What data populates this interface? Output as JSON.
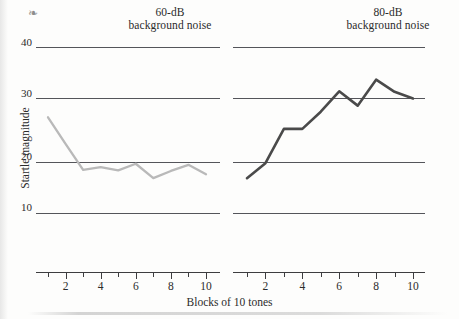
{
  "figure": {
    "ylabel": "Startle magnitude",
    "xlabel": "Blocks of 10 tones",
    "scan_mark": "❧"
  },
  "panels": [
    {
      "id": "left",
      "title_line1": "60-dB",
      "title_line2": "background noise",
      "color": "#b9b9b9"
    },
    {
      "id": "right",
      "title_line1": "80-dB",
      "title_line2": "background noise",
      "color": "#4a4a4a"
    }
  ],
  "yticks": [
    "40",
    "30",
    "20",
    "10"
  ],
  "xticklabels": [
    "2",
    "4",
    "6",
    "8",
    "10"
  ],
  "chart_data": {
    "type": "line",
    "xlabel": "Blocks of 10 tones",
    "ylabel": "Startle magnitude",
    "xlim": [
      1,
      10
    ],
    "ylim": [
      10,
      40
    ],
    "yticks": [
      10,
      20,
      30,
      40
    ],
    "xticks": [
      1,
      2,
      3,
      4,
      5,
      6,
      7,
      8,
      9,
      10
    ],
    "xticklabels_shown": [
      2,
      4,
      6,
      8,
      10
    ],
    "grid": "horizontal gridlines at y = 10, 20, 30, 40",
    "legend": "none (panel titles label the series)",
    "panels": [
      {
        "name": "60-dB background noise",
        "color": "#b9b9b9",
        "x": [
          1,
          2,
          3,
          4,
          5,
          6,
          7,
          8,
          9,
          10
        ],
        "values": [
          27.3,
          22.5,
          17.8,
          18.3,
          17.7,
          18.9,
          16.3,
          17.6,
          18.7,
          17.0
        ]
      },
      {
        "name": "80-dB background noise",
        "color": "#4a4a4a",
        "x": [
          1,
          2,
          3,
          4,
          5,
          6,
          7,
          8,
          9,
          10
        ],
        "values": [
          16.3,
          19.0,
          25.2,
          25.2,
          28.3,
          32.0,
          29.4,
          34.1,
          31.9,
          30.7
        ]
      }
    ]
  }
}
